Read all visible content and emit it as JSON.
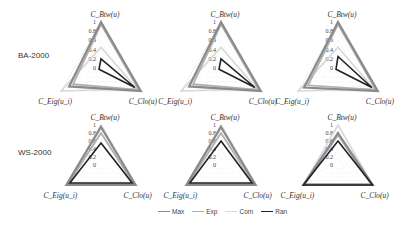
{
  "row_labels": [
    "BA-2000",
    "WS-2000"
  ],
  "axes": {
    "top": "C_Btw(u)",
    "right": "C_Clo(u)",
    "left": "C_Eig(u_i)"
  },
  "ticks": [
    "0",
    "0.2",
    "0.4",
    "0.6",
    "0.8",
    "1"
  ],
  "legend": [
    {
      "label": "Max",
      "color": "#8a8a8a"
    },
    {
      "label": "Exp",
      "color": "#b0b0b0"
    },
    {
      "label": "Com",
      "color": "#d8d8d8"
    },
    {
      "label": "Ran",
      "color": "#222222"
    }
  ],
  "chart_data": [
    {
      "type": "radar",
      "title": "BA-2000 (1)",
      "axes": [
        "C_Btw(u)",
        "C_Clo(u)",
        "C_Eig(u_i)"
      ],
      "rlim": [
        0,
        1
      ],
      "series": [
        {
          "name": "Max",
          "values": [
            1.0,
            1.0,
            0.8
          ]
        },
        {
          "name": "Exp",
          "values": [
            0.95,
            0.95,
            0.7
          ]
        },
        {
          "name": "Com",
          "values": [
            0.45,
            0.9,
            1.0
          ]
        },
        {
          "name": "Ran",
          "values": [
            0.2,
            0.85,
            0.05
          ]
        }
      ]
    },
    {
      "type": "radar",
      "title": "BA-2000 (2)",
      "axes": [
        "C_Btw(u)",
        "C_Clo(u)",
        "C_Eig(u_i)"
      ],
      "rlim": [
        0,
        1
      ],
      "series": [
        {
          "name": "Max",
          "values": [
            1.0,
            1.0,
            0.8
          ]
        },
        {
          "name": "Exp",
          "values": [
            0.95,
            0.95,
            0.7
          ]
        },
        {
          "name": "Com",
          "values": [
            0.45,
            0.9,
            1.0
          ]
        },
        {
          "name": "Ran",
          "values": [
            0.2,
            0.85,
            0.05
          ]
        }
      ]
    },
    {
      "type": "radar",
      "title": "BA-2000 (3)",
      "axes": [
        "C_Btw(u)",
        "C_Clo(u)",
        "C_Eig(u_i)"
      ],
      "rlim": [
        0,
        1
      ],
      "series": [
        {
          "name": "Max",
          "values": [
            1.0,
            1.0,
            0.85
          ]
        },
        {
          "name": "Exp",
          "values": [
            0.95,
            0.95,
            0.75
          ]
        },
        {
          "name": "Com",
          "values": [
            0.45,
            0.9,
            1.0
          ]
        },
        {
          "name": "Ran",
          "values": [
            0.25,
            0.85,
            0.05
          ]
        }
      ]
    },
    {
      "type": "radar",
      "title": "WS-2000 (1)",
      "axes": [
        "C_Btw(u)",
        "C_Clo(u)",
        "C_Eig(u_i)"
      ],
      "rlim": [
        0,
        1
      ],
      "series": [
        {
          "name": "Max",
          "values": [
            0.95,
            1.0,
            1.0
          ]
        },
        {
          "name": "Exp",
          "values": [
            0.8,
            0.95,
            0.95
          ]
        },
        {
          "name": "Com",
          "values": [
            1.0,
            1.0,
            1.0
          ]
        },
        {
          "name": "Ran",
          "values": [
            0.55,
            0.9,
            0.9
          ]
        }
      ]
    },
    {
      "type": "radar",
      "title": "WS-2000 (2)",
      "axes": [
        "C_Btw(u)",
        "C_Clo(u)",
        "C_Eig(u_i)"
      ],
      "rlim": [
        0,
        1
      ],
      "series": [
        {
          "name": "Max",
          "values": [
            0.95,
            1.0,
            1.0
          ]
        },
        {
          "name": "Exp",
          "values": [
            0.8,
            0.95,
            0.95
          ]
        },
        {
          "name": "Com",
          "values": [
            1.0,
            1.0,
            1.0
          ]
        },
        {
          "name": "Ran",
          "values": [
            0.6,
            0.9,
            0.9
          ]
        }
      ]
    },
    {
      "type": "radar",
      "title": "WS-2000 (3)",
      "axes": [
        "C_Btw(u)",
        "C_Clo(u)",
        "C_Eig(u_i)"
      ],
      "rlim": [
        0,
        1
      ],
      "series": [
        {
          "name": "Max",
          "values": [
            0.8,
            1.0,
            1.0
          ]
        },
        {
          "name": "Exp",
          "values": [
            0.75,
            0.95,
            0.95
          ]
        },
        {
          "name": "Com",
          "values": [
            1.0,
            1.0,
            1.0
          ]
        },
        {
          "name": "Ran",
          "values": [
            0.6,
            1.0,
            1.0
          ]
        }
      ]
    }
  ]
}
